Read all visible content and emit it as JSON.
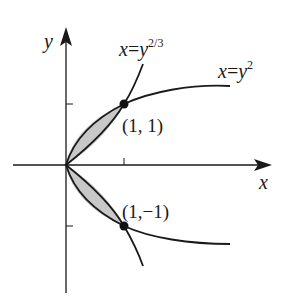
{
  "figure": {
    "axes": {
      "x_label": "x",
      "y_label": "y"
    },
    "curves": [
      {
        "name": "x=y^2",
        "label_lhs": "x",
        "label_eq": "=",
        "label_base": "y",
        "label_exp": "2"
      },
      {
        "name": "x=y^(2/3)",
        "label_lhs": "x",
        "label_eq": "=",
        "label_base": "y",
        "label_exp": "2/3"
      }
    ],
    "points": [
      {
        "label": "(1, 1)",
        "x": 1,
        "y": 1
      },
      {
        "label": "(1,−1)",
        "x": 1,
        "y": -1
      }
    ],
    "shading_color": "#c8c8c8",
    "line_color": "#1a1a1a"
  }
}
